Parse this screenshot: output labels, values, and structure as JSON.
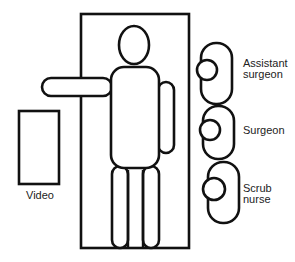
{
  "diagram": {
    "type": "operating-room-layout",
    "colors": {
      "line": "#111111",
      "background": "#ffffff",
      "text": "#222222"
    },
    "elements": {
      "video": {
        "label": "Video"
      },
      "table": {
        "label": ""
      },
      "patient": {
        "label": ""
      },
      "staff": [
        {
          "label_line1": "Assistant",
          "label_line2": "surgeon"
        },
        {
          "label_line1": "Surgeon",
          "label_line2": ""
        },
        {
          "label_line1": "Scrub",
          "label_line2": "nurse"
        }
      ]
    }
  }
}
